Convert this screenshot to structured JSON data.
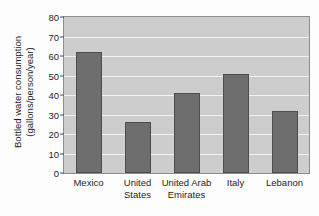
{
  "chart_data": {
    "type": "bar",
    "title": "",
    "xlabel": "",
    "ylabel": "Bottled water consumption (gallons/person/year)",
    "ylabel_lines": [
      "Bottled water consumption",
      "(gallons/person/year)"
    ],
    "categories": [
      "Mexico",
      "United States",
      "United Arab Emirates",
      "Italy",
      "Lebanon"
    ],
    "category_lines": [
      [
        "Mexico"
      ],
      [
        "United",
        "States"
      ],
      [
        "United Arab",
        "Emirates"
      ],
      [
        "Italy"
      ],
      [
        "Lebanon"
      ]
    ],
    "values": [
      62,
      26,
      41,
      51,
      32
    ],
    "ylim": [
      0,
      80
    ],
    "yticks": [
      0,
      10,
      20,
      30,
      40,
      50,
      60,
      70,
      80
    ],
    "ytick_labels": [
      "0",
      "10",
      "20",
      "30",
      "40",
      "50",
      "60",
      "70",
      "80"
    ],
    "grid": true,
    "legend": "none",
    "colors": {
      "bar_fill": "#6e6e6e",
      "bar_edge": "#4d4d4d",
      "plot_background": "#cdcdcd",
      "gridline": "#f2f2f2",
      "axis": "#8d8d8d",
      "text": "#1d1d1d",
      "page_background": "#fdfdfd"
    }
  }
}
